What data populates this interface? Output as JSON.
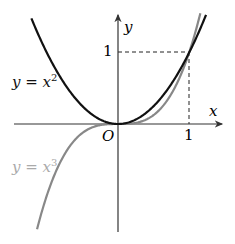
{
  "diagram": {
    "title": "",
    "axes": {
      "x_label": "x",
      "y_label": "y",
      "origin_label": "O",
      "x_tick": "1",
      "y_tick": "1"
    },
    "curves": [
      {
        "name": "parabola",
        "label_main": "y = x",
        "label_exp": "2",
        "color": "#111111"
      },
      {
        "name": "cubic",
        "label_main": "y = x",
        "label_exp": "3",
        "color": "#888888"
      }
    ],
    "guide_point": {
      "x": 1,
      "y": 1,
      "style": "dashed"
    }
  }
}
